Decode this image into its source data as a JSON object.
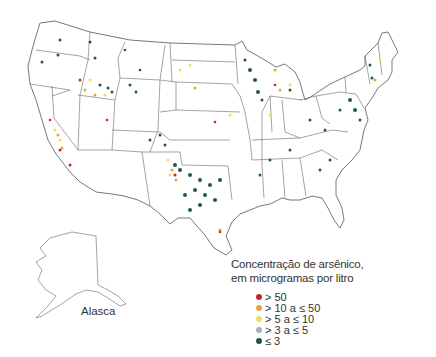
{
  "map": {
    "title_line1": "Concentração de arsênico,",
    "title_line2": "em microgramas por litro",
    "inset_label": "Alasca",
    "colors": {
      "border": "#555555",
      "gt50": "#c62828",
      "gt10_le50": "#e8a33a",
      "gt5_le10": "#f4dc5a",
      "gt3_le5": "#a9aeb0",
      "le3": "#1f5a42"
    },
    "legend": [
      {
        "label": "> 50",
        "color": "#c62828"
      },
      {
        "label": "> 10 a ≤ 50",
        "color": "#e8a33a"
      },
      {
        "label": "> 5 a ≤ 10",
        "color": "#f4dc5a"
      },
      {
        "label": "> 3 a ≤ 5",
        "color": "#a9aeb0"
      },
      {
        "label": "≤ 3",
        "color": "#1f5a42"
      }
    ]
  }
}
